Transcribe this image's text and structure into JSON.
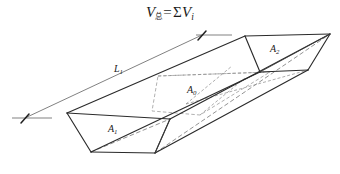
{
  "figure": {
    "formula": {
      "lhs_variable": "V",
      "lhs_subscript": "总",
      "equals": "=",
      "sigma": "Σ",
      "rhs_variable": "V",
      "rhs_subscript": "i",
      "full_text": "V总 = ΣVi"
    },
    "labels": {
      "area_near": "A",
      "area_near_sub": "1",
      "area_mid": "A",
      "area_mid_sub": "0",
      "area_far": "A",
      "area_far_sub": "2",
      "length": "L",
      "length_sub": "1"
    },
    "colors": {
      "background": "#ffffff",
      "solid_edge": "#2b2b2b",
      "hidden_edge": "#6f6f6f",
      "section_edge": "#8f8f8f",
      "dimension_line": "#4a4a4a",
      "text": "#1a1a1a"
    },
    "icon_names": {
      "dimension_arrow_left": "dimension-arrow-tick-icon",
      "dimension_arrow_right": "dimension-arrow-tick-icon"
    }
  }
}
